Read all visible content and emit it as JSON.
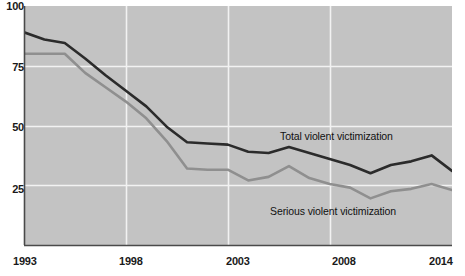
{
  "chart_data": {
    "type": "line",
    "title": "",
    "subtitle": "",
    "xlabel": "",
    "ylabel": "",
    "xlim": [
      1993,
      2014
    ],
    "ylim": [
      0,
      100
    ],
    "yticks": [
      100,
      75,
      50,
      25
    ],
    "xticks": [
      1993,
      1998,
      2003,
      2008,
      2014
    ],
    "grid": "horizontal-and-vertical",
    "legend_position": "inline-annotations",
    "x": [
      1993,
      1994,
      1995,
      1996,
      1997,
      1998,
      1999,
      2000,
      2001,
      2002,
      2003,
      2004,
      2005,
      2006,
      2007,
      2008,
      2009,
      2010,
      2011,
      2012,
      2013,
      2014
    ],
    "series": [
      {
        "name": "Total violent victimization",
        "color": "#2b2b2b",
        "values": [
          89.0,
          86.0,
          84.5,
          78.0,
          71.0,
          64.5,
          58.0,
          49.5,
          43.0,
          42.5,
          42.0,
          39.0,
          38.5,
          41.0,
          38.5,
          36.0,
          33.5,
          30.0,
          33.5,
          35.0,
          37.5,
          31.0
        ]
      },
      {
        "name": "Serious violent victimization",
        "color": "#8f8f8f",
        "values": [
          80.0,
          80.0,
          80.0,
          72.0,
          66.0,
          60.0,
          53.0,
          43.5,
          32.0,
          31.5,
          31.5,
          27.0,
          28.5,
          33.0,
          28.0,
          25.5,
          24.0,
          19.5,
          22.5,
          23.5,
          25.5,
          23.0
        ]
      }
    ],
    "annotations": [
      {
        "text": "Total violent victimization",
        "x": 2005,
        "y": 47
      },
      {
        "text": "Serious violent victimization",
        "x": 2004,
        "y": 14
      }
    ]
  },
  "axis": {
    "y_tick_labels": [
      "100",
      "75",
      "50",
      "25"
    ],
    "x_tick_labels": [
      "1993",
      "1998",
      "2003",
      "2008",
      "2014"
    ]
  },
  "colors": {
    "plot_background": "#c3c3c3",
    "gridline": "#f2f2f2",
    "axis_line": "#4a4a4a",
    "total_series": "#2b2b2b",
    "serious_series": "#8f8f8f",
    "text": "#1a1a1a"
  }
}
